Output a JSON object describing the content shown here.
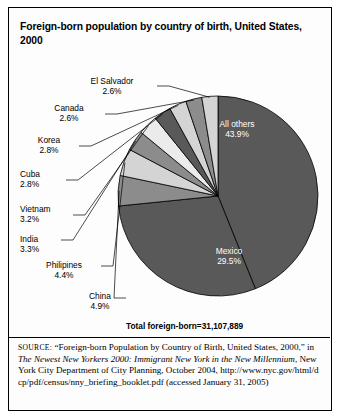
{
  "figure": {
    "title": "Foreign-born population by country of birth, United States, 2000",
    "total_label": "Total foreign-born=31,107,889"
  },
  "source": {
    "prefix": "SOURCE:",
    "part1": " “Foreign-born Population by Country of Birth, United States, 2000,” in ",
    "italic": "The Newest New Yorkers 2000: Immigrant New York in the New Millennium",
    "part2": ", New York City Department of City Planning, October 2004, ",
    "url": "http://www.nyc.gov/html/dcp/pdf/census/nny_briefing_booklet.pdf",
    "part3": " (accessed January 31, 2005)"
  },
  "colors": {
    "dark_gray": "#595959",
    "mid_gray": "#8c8c8c",
    "light_gray": "#d4d4d4",
    "pale_gray": "#ebebeb",
    "outline": "#000000",
    "text": "#000000",
    "inner_text": "#ffffff"
  },
  "chart_data": {
    "type": "pie",
    "title": "Foreign-born population by country of birth, United States, 2000",
    "unit": "percent",
    "total": "31,107,889",
    "total_label": "Total foreign-born=31,107,889",
    "legend": "none",
    "grid": false,
    "start_angle_deg": 0,
    "direction": "clockwise",
    "categories": [
      "All others",
      "Mexico",
      "China",
      "Philipines",
      "India",
      "Vietnam",
      "Cuba",
      "Korea",
      "Canada",
      "El Salvador"
    ],
    "values": [
      43.9,
      29.5,
      4.9,
      4.4,
      3.3,
      3.2,
      2.8,
      2.8,
      2.6,
      2.6
    ],
    "slices": [
      {
        "label": "All others",
        "value": 43.9,
        "value_text": "43.9%",
        "color": "#595959",
        "label_position": "inside",
        "text_color": "#ffffff"
      },
      {
        "label": "Mexico",
        "value": 29.5,
        "value_text": "29.5%",
        "color": "#595959",
        "label_position": "inside",
        "text_color": "#ffffff"
      },
      {
        "label": "China",
        "value": 4.9,
        "value_text": "4.9%",
        "color": "#8c8c8c",
        "label_position": "outside",
        "text_color": "#000000"
      },
      {
        "label": "Philipines",
        "value": 4.4,
        "value_text": "4.4%",
        "color": "#d4d4d4",
        "label_position": "outside",
        "text_color": "#000000"
      },
      {
        "label": "India",
        "value": 3.3,
        "value_text": "3.3%",
        "color": "#8c8c8c",
        "label_position": "outside",
        "text_color": "#000000"
      },
      {
        "label": "Vietnam",
        "value": 3.2,
        "value_text": "3.2%",
        "color": "#ebebeb",
        "label_position": "outside",
        "text_color": "#000000"
      },
      {
        "label": "Cuba",
        "value": 2.8,
        "value_text": "2.8%",
        "color": "#595959",
        "label_position": "outside",
        "text_color": "#000000"
      },
      {
        "label": "Korea",
        "value": 2.8,
        "value_text": "2.8%",
        "color": "#d4d4d4",
        "label_position": "outside",
        "text_color": "#000000"
      },
      {
        "label": "Canada",
        "value": 2.6,
        "value_text": "2.6%",
        "color": "#8c8c8c",
        "label_position": "outside",
        "text_color": "#000000"
      },
      {
        "label": "El Salvador",
        "value": 2.6,
        "value_text": "2.6%",
        "color": "#d4d4d4",
        "label_position": "outside",
        "text_color": "#000000"
      }
    ]
  },
  "labels": {
    "el_salvador": {
      "name": "El Salvador",
      "pct": "2.6%"
    },
    "canada": {
      "name": "Canada",
      "pct": "2.6%"
    },
    "korea": {
      "name": "Korea",
      "pct": "2.8%"
    },
    "cuba": {
      "name": "Cuba",
      "pct": "2.8%"
    },
    "vietnam": {
      "name": "Vietnam",
      "pct": "3.2%"
    },
    "india": {
      "name": "India",
      "pct": "3.3%"
    },
    "philipines": {
      "name": "Philipines",
      "pct": "4.4%"
    },
    "china": {
      "name": "China",
      "pct": "4.9%"
    },
    "all_others": {
      "name": "All others",
      "pct": "43.9%"
    },
    "mexico": {
      "name": "Mexico",
      "pct": "29.5%"
    }
  }
}
